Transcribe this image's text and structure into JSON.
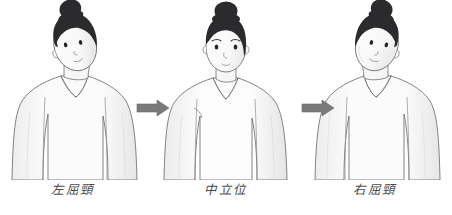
{
  "illustration": {
    "title": "Neck lateral flexion range-of-motion illustration",
    "background_color": "#ffffff",
    "width": 452,
    "height": 215
  },
  "palette": {
    "hair": "#2b2b2e",
    "outline": "#5a5a5a",
    "skin": "#fbfbfb",
    "shirt": "#fdfdfd",
    "shading": "#e9e9ea",
    "arrow": "#7a7a7a",
    "caption_text": "#4a4a4a"
  },
  "panels": [
    {
      "id": "left",
      "caption": "左屈頸",
      "pose": "head-tilted-left",
      "tilt_degrees": -18,
      "description": "Figure with head laterally flexed toward the left side"
    },
    {
      "id": "middle",
      "caption": "中立位",
      "pose": "neutral",
      "tilt_degrees": 0,
      "description": "Figure with head in neutral upright position facing forward"
    },
    {
      "id": "right",
      "caption": "右屈頸",
      "pose": "head-tilted-right",
      "tilt_degrees": 18,
      "description": "Figure with head laterally flexed toward the right side"
    }
  ],
  "arrows": [
    {
      "id": "arrow-1",
      "direction": "right",
      "color": "#7a7a7a"
    },
    {
      "id": "arrow-2",
      "direction": "right",
      "color": "#7a7a7a"
    }
  ]
}
